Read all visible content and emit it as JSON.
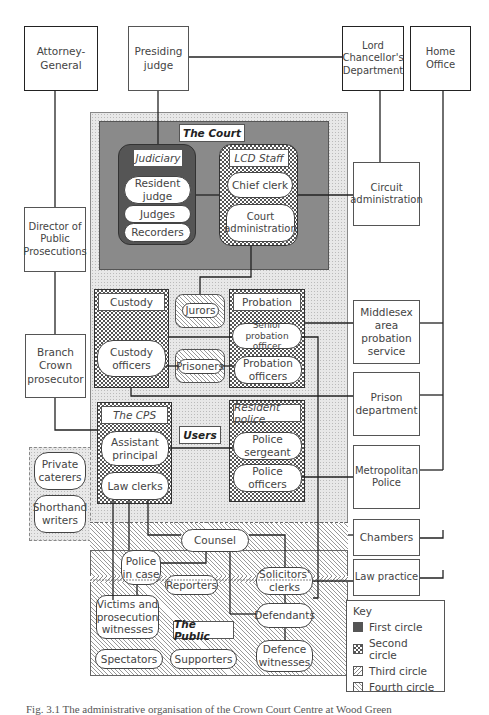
{
  "external": {
    "attorney_general": "Attorney-General",
    "presiding_judge": "Presiding judge",
    "lcd": "Lord Chancellor's Department",
    "home_office": "Home Office",
    "dpp": "Director of Public Prosecutions",
    "circuit_admin": "Circuit administration",
    "branch_crown": "Branch Crown prosecutor",
    "middlesex": "Middlesex area probation service",
    "prison_dept": "Prison department",
    "met_police": "Metropolitan Police",
    "chambers": "Chambers",
    "law_practice": "Law practice"
  },
  "court": {
    "title": "The Court",
    "judiciary": {
      "title": "Judiciary",
      "items": [
        "Resident judge",
        "Judges",
        "Recorders"
      ]
    },
    "lcd_staff": {
      "title": "LCD Staff",
      "items": [
        "Chief clerk",
        "Court administration"
      ]
    }
  },
  "users": {
    "title": "Users",
    "custody": {
      "title": "Custody",
      "items": [
        "Custody officers"
      ]
    },
    "jurors": "Jurors",
    "prisoners": "Prisoners",
    "probation": {
      "title": "Probation",
      "items": [
        "Senior probation officer",
        "Probation officers"
      ]
    },
    "cps": {
      "title": "The CPS",
      "items": [
        "Assistant principal",
        "Law clerks"
      ]
    },
    "resident_police": {
      "title": "Resident police",
      "items": [
        "Police sergeant",
        "Police officers"
      ]
    }
  },
  "third_circle_side": [
    "Private caterers",
    "Shorthand writers"
  ],
  "public": {
    "title": "The Public",
    "counsel": "Counsel",
    "police_in_case": "Police in case",
    "reporters": "Reporters",
    "solicitors_clerks": "Solicitors' clerks",
    "victims": "Victims and prosecution witnesses",
    "defendants": "Defendants",
    "spectators": "Spectators",
    "supporters": "Supporters",
    "defence_witnesses": "Defence witnesses"
  },
  "key": {
    "title": "Key",
    "items": [
      "First circle",
      "Second circle",
      "Third circle",
      "Fourth circle"
    ]
  },
  "caption": "Fig. 3.1 The administrative organisation of the Crown Court Centre at Wood Green"
}
